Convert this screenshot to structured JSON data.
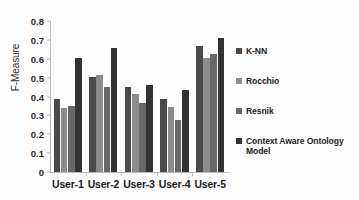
{
  "chart_data": {
    "type": "bar",
    "title": "",
    "subtitle": "",
    "xlabel": "",
    "ylabel": "F-Measure",
    "ylim": [
      0,
      0.8
    ],
    "ytick_labels": [
      "0.8",
      "0.7",
      "0.6",
      "0.5",
      "0.4",
      "0.3",
      "0.2",
      "0.1",
      "0"
    ],
    "ytick_values": [
      0.8,
      0.7,
      0.6,
      0.5,
      0.4,
      0.3,
      0.2,
      0.1,
      0
    ],
    "grid": false,
    "legend_position": "right",
    "categories": [
      "User-1",
      "User-2",
      "User-3",
      "User-4",
      "User-5"
    ],
    "series": [
      {
        "name": "K-NN",
        "color": "#4a4a4a",
        "values": [
          0.385,
          0.505,
          0.453,
          0.385,
          0.665
        ]
      },
      {
        "name": "Rocchio",
        "color": "#8c8c8c",
        "values": [
          0.34,
          0.512,
          0.415,
          0.345,
          0.603
        ]
      },
      {
        "name": "Resnik",
        "color": "#676767",
        "values": [
          0.348,
          0.453,
          0.363,
          0.275,
          0.623
        ]
      },
      {
        "name": "Context Aware Ontology Model",
        "color": "#333333",
        "values": [
          0.605,
          0.657,
          0.463,
          0.432,
          0.712
        ]
      }
    ]
  },
  "legend": {
    "entries": [
      {
        "label": "K-NN"
      },
      {
        "label": "Rocchio"
      },
      {
        "label": "Resnik"
      },
      {
        "label": "Context Aware Ontology",
        "label2": "Model"
      }
    ]
  }
}
